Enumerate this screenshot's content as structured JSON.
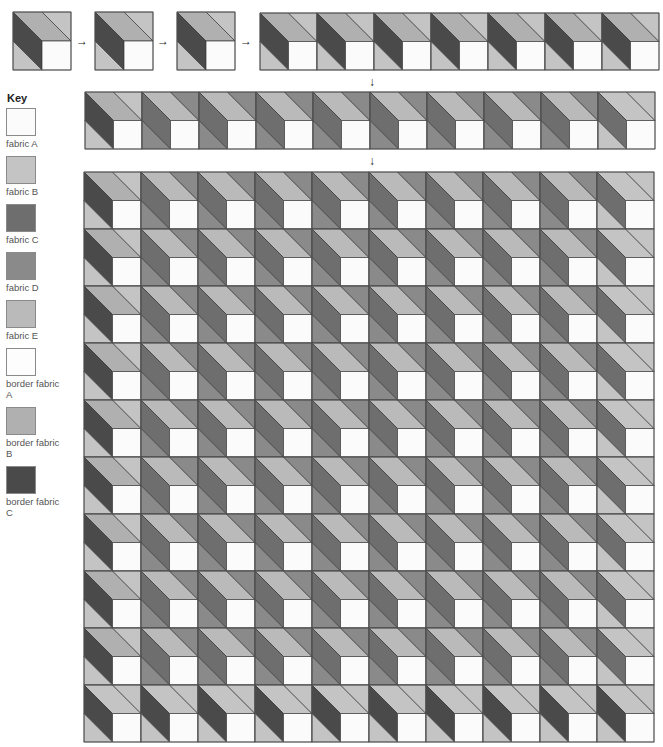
{
  "key": {
    "title": "Key",
    "items": [
      {
        "label": "fabric A",
        "color": "#fbfbfb"
      },
      {
        "label": "fabric B",
        "color": "#c4c4c4"
      },
      {
        "label": "fabric C",
        "color": "#6e6e6e"
      },
      {
        "label": "fabric D",
        "color": "#8a8a8a"
      },
      {
        "label": "fabric E",
        "color": "#bababa"
      },
      {
        "label": "border fabric A",
        "color": "#fdfdfd"
      },
      {
        "label": "border fabric B",
        "color": "#b0b0b0"
      },
      {
        "label": "border fabric C",
        "color": "#4a4a4a"
      }
    ]
  },
  "palette": {
    "A": "#fbfbfb",
    "B": "#c4c4c4",
    "C": "#6e6e6e",
    "D": "#8a8a8a",
    "E": "#bababa",
    "bA": "#fdfdfd",
    "bB": "#b0b0b0",
    "bC": "#4a4a4a",
    "stroke": "#3a3a3a"
  },
  "block_types": {
    "edge": {
      "top": "bB",
      "tr": "B",
      "left": "bC",
      "bl": "B",
      "sq": "A"
    },
    "inner": {
      "top": "E",
      "tr": "D",
      "left": "C",
      "bl": "D",
      "sq": "A"
    },
    "right_edge": {
      "top": "B",
      "tr": "B",
      "left": "C",
      "bl": "B",
      "sq": "A"
    },
    "bottom": {
      "top": "B",
      "tr": "B",
      "left": "bC",
      "bl": "B",
      "sq": "A"
    }
  },
  "steps": {
    "single_blocks": [
      {
        "x": 13,
        "y": 12,
        "size": 58,
        "type": "edge"
      },
      {
        "x": 95,
        "y": 12,
        "size": 58,
        "type": "edge"
      },
      {
        "x": 177,
        "y": 12,
        "size": 58,
        "type": "edge"
      }
    ],
    "right_arrows": [
      {
        "x": 76,
        "y": 35,
        "glyph": "→"
      },
      {
        "x": 157,
        "y": 35,
        "glyph": "→"
      },
      {
        "x": 240,
        "y": 35,
        "glyph": "→"
      }
    ],
    "down_arrows": [
      {
        "x": 369,
        "y": 76,
        "glyph": "↓"
      },
      {
        "x": 369,
        "y": 155,
        "glyph": "↓"
      }
    ],
    "strip1": {
      "x": 260,
      "y": 13,
      "size": 57,
      "types": [
        "edge",
        "edge",
        "edge",
        "edge",
        "edge",
        "edge",
        "edge"
      ]
    },
    "strip2": {
      "x": 85,
      "y": 92,
      "size": 57,
      "types": [
        "edge",
        "inner",
        "inner",
        "inner",
        "inner",
        "inner",
        "inner",
        "inner",
        "inner",
        "right_edge"
      ]
    },
    "quilt": {
      "x": 84,
      "y": 172,
      "size": 57,
      "cols": 10,
      "rows": 10,
      "row_types": [
        [
          "edge",
          "inner",
          "inner",
          "inner",
          "inner",
          "inner",
          "inner",
          "inner",
          "inner",
          "right_edge"
        ],
        [
          "edge",
          "inner",
          "inner",
          "inner",
          "inner",
          "inner",
          "inner",
          "inner",
          "inner",
          "right_edge"
        ],
        [
          "edge",
          "inner",
          "inner",
          "inner",
          "inner",
          "inner",
          "inner",
          "inner",
          "inner",
          "right_edge"
        ],
        [
          "edge",
          "inner",
          "inner",
          "inner",
          "inner",
          "inner",
          "inner",
          "inner",
          "inner",
          "right_edge"
        ],
        [
          "edge",
          "inner",
          "inner",
          "inner",
          "inner",
          "inner",
          "inner",
          "inner",
          "inner",
          "right_edge"
        ],
        [
          "edge",
          "inner",
          "inner",
          "inner",
          "inner",
          "inner",
          "inner",
          "inner",
          "inner",
          "right_edge"
        ],
        [
          "edge",
          "inner",
          "inner",
          "inner",
          "inner",
          "inner",
          "inner",
          "inner",
          "inner",
          "right_edge"
        ],
        [
          "edge",
          "inner",
          "inner",
          "inner",
          "inner",
          "inner",
          "inner",
          "inner",
          "inner",
          "right_edge"
        ],
        [
          "edge",
          "inner",
          "inner",
          "inner",
          "inner",
          "inner",
          "inner",
          "inner",
          "inner",
          "right_edge"
        ],
        [
          "bottom",
          "bottom",
          "bottom",
          "bottom",
          "bottom",
          "bottom",
          "bottom",
          "bottom",
          "bottom",
          "bottom"
        ]
      ]
    }
  }
}
